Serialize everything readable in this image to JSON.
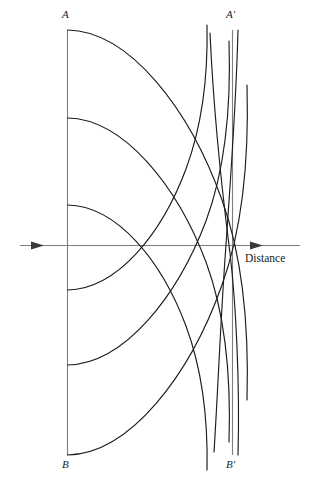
{
  "figure": {
    "type": "wavefront-construction-diagram",
    "background_color": "#ffffff",
    "labels": {
      "top_left": "A",
      "top_right": "A′",
      "bottom_left": "B",
      "bottom_right": "B′",
      "axis": "Distance"
    },
    "colors": {
      "arc_stroke": "#1c1c1c",
      "construction_stroke": "#7d7d7d",
      "axis_stroke": "#7d7d7d",
      "arrow_fill": "#3a3a3a",
      "text": "#1a1a1a"
    },
    "geometry": {
      "left_line": {
        "x": 67,
        "y_top": 30,
        "y_bottom": 455
      },
      "right_line": {
        "x": 232,
        "y_top": 30,
        "y_bottom": 455
      },
      "axis": {
        "y": 245,
        "x_start": 20,
        "x_end": 300
      },
      "arc_origins_y": [
        30,
        118,
        205,
        290,
        365,
        455
      ],
      "arc_radius": 215,
      "secondary_curve_count": 3
    }
  }
}
